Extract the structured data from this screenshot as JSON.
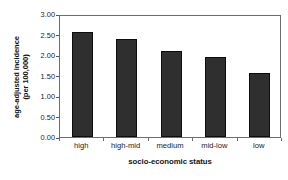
{
  "chart_data": {
    "type": "bar",
    "title": "",
    "subtitle": "",
    "xlabel": "socio-economic status",
    "ylabel": "age-adjusted incidence (per 100,000)",
    "ylabel_lines": [
      "age-adjusted incidence",
      "(per 100,000)"
    ],
    "categories": [
      "high",
      "high-mid",
      "medium",
      "mid-low",
      "low"
    ],
    "values": [
      2.55,
      2.4,
      2.1,
      1.95,
      1.55
    ],
    "ylim": [
      0.0,
      3.0
    ],
    "ytick_labels": [
      "0.00",
      "0.50",
      "1.00",
      "1.50",
      "2.00",
      "2.50",
      "3.00"
    ],
    "ytick_values": [
      0.0,
      0.5,
      1.0,
      1.5,
      2.0,
      2.5,
      3.0
    ],
    "grid": false,
    "legend": false,
    "legend_position": "none",
    "bar_color": "#2f2f2f",
    "bar_edge_color": "#0d0d0d",
    "axis_color": "#6b6e70",
    "background_color": "#ffffff"
  }
}
